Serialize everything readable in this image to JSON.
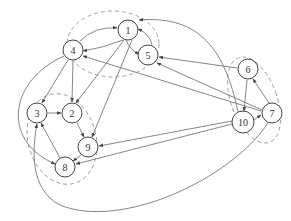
{
  "diagram": {
    "type": "directed-graph",
    "colors": {
      "edge": "#777777",
      "node_stroke": "#444444",
      "cluster": "#999999",
      "text": "#333333"
    },
    "clusters": [
      {
        "id": "c1",
        "cx": 113,
        "cy": 44,
        "rx": 46,
        "ry": 33,
        "nodes": [
          "1",
          "4",
          "5"
        ]
      },
      {
        "id": "c2",
        "cx": 62,
        "cy": 139,
        "rx": 34,
        "ry": 46,
        "nodes": [
          "3",
          "2",
          "9",
          "8"
        ]
      },
      {
        "id": "c3",
        "cx": 254,
        "cy": 100,
        "rx": 23,
        "ry": 45,
        "nodes": [
          "6",
          "10",
          "7"
        ]
      }
    ],
    "nodes": [
      {
        "id": "1",
        "label": "1",
        "x": 128,
        "y": 30
      },
      {
        "id": "4",
        "label": "4",
        "x": 73,
        "y": 50
      },
      {
        "id": "5",
        "label": "5",
        "x": 148,
        "y": 55
      },
      {
        "id": "3",
        "label": "3",
        "x": 37,
        "y": 113
      },
      {
        "id": "2",
        "label": "2",
        "x": 72,
        "y": 113
      },
      {
        "id": "9",
        "label": "9",
        "x": 88,
        "y": 147
      },
      {
        "id": "8",
        "label": "8",
        "x": 65,
        "y": 167
      },
      {
        "id": "6",
        "label": "6",
        "x": 248,
        "y": 69
      },
      {
        "id": "10",
        "label": "10",
        "x": 243,
        "y": 122
      },
      {
        "id": "7",
        "label": "7",
        "x": 272,
        "y": 113
      }
    ],
    "edges": [
      {
        "from": "4",
        "to": "1",
        "d": "M 80 41 Q 95 26 117 28"
      },
      {
        "from": "1",
        "to": "4",
        "d": "M 123 40 Q 103 48 83 51"
      },
      {
        "from": "5",
        "to": "1",
        "d": "M 152 45 Q 150 34 138 29"
      },
      {
        "from": "1",
        "to": "5",
        "d": "M 126 40 Q 130 50 139 54"
      },
      {
        "from": "1",
        "to": "2",
        "d": "M 124 40 L 76 103"
      },
      {
        "from": "1",
        "to": "9",
        "d": "M 132 40 L 92 137"
      },
      {
        "from": "4",
        "to": "2",
        "d": "M 73 61 L 72 102"
      },
      {
        "from": "4",
        "to": "3",
        "d": "M 68 60 L 42 103"
      },
      {
        "from": "3",
        "to": "2",
        "d": "M 48 113 L 61 113"
      },
      {
        "from": "2",
        "to": "9",
        "d": "M 77 123 L 84 137"
      },
      {
        "from": "9",
        "to": "8",
        "d": "M 81 155 L 73 161"
      },
      {
        "from": "8",
        "to": "3",
        "d": "M 60 158 L 41 123"
      },
      {
        "from": "4",
        "to": "8",
        "d": "M 64 56 C 10 80 0 140 55 164"
      },
      {
        "from": "6",
        "to": "10",
        "d": "M 247 80 L 244 111"
      },
      {
        "from": "7",
        "to": "6",
        "d": "M 269 103 L 253 79"
      },
      {
        "from": "10",
        "to": "7",
        "d": "M 254 120 L 261 115"
      },
      {
        "from": "6",
        "to": "5",
        "d": "M 237 68 L 159 57"
      },
      {
        "from": "7",
        "to": "5",
        "d": "M 262 110 L 157 63"
      },
      {
        "from": "7",
        "to": "4",
        "d": "M 261 111 L 83 56"
      },
      {
        "from": "10",
        "to": "9",
        "d": "M 232 121 L 99 146"
      },
      {
        "from": "10",
        "to": "8",
        "d": "M 232 124 L 76 164"
      },
      {
        "from": "10",
        "to": "1",
        "d": "M 238 112 C 225 50 200 15 139 20"
      },
      {
        "from": "7",
        "to": "3",
        "d": "M 268 123 C 230 180 120 230 60 205 C 30 190 32 150 37 124"
      }
    ]
  }
}
